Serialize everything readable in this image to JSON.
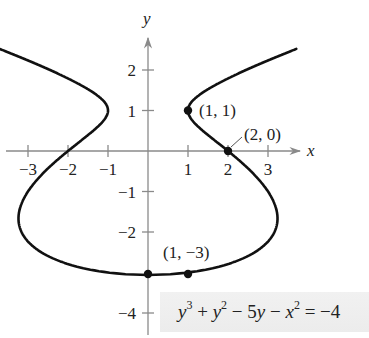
{
  "diagram": {
    "equation": {
      "lhs_terms": [
        "y^3",
        "+",
        "y^2",
        "−",
        "5y",
        "−",
        "x^2"
      ],
      "rhs": "−4",
      "display": "y³ + y² − 5y − x² = −4"
    },
    "axes": {
      "x_label": "x",
      "y_label": "y",
      "x_ticks": [
        {
          "value": -3,
          "label": "−3"
        },
        {
          "value": -2,
          "label": "−2"
        },
        {
          "value": -1,
          "label": "−1"
        },
        {
          "value": 1,
          "label": "1"
        },
        {
          "value": 2,
          "label": "2"
        },
        {
          "value": 3,
          "label": "3"
        }
      ],
      "y_ticks": [
        {
          "value": 2,
          "label": "2"
        },
        {
          "value": 1,
          "label": "1"
        },
        {
          "value": -1,
          "label": "−1"
        },
        {
          "value": -2,
          "label": "−2"
        },
        {
          "value": -4,
          "label": "−4"
        }
      ]
    },
    "points": [
      {
        "x": 1,
        "y": 1,
        "label": "(1, 1)"
      },
      {
        "x": 2,
        "y": 0,
        "label": "(2, 0)"
      },
      {
        "x": 1,
        "y": -3,
        "label": "(1, −3)"
      },
      {
        "x": 0,
        "y": -3,
        "label": ""
      }
    ],
    "colors": {
      "curve": "#111111",
      "axis": "#8a8a8a",
      "text": "#222222",
      "eq_box": "#eeeeee"
    }
  }
}
